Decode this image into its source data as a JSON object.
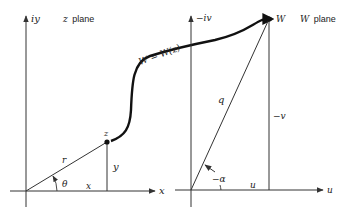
{
  "left_plane": {
    "title_var": "z",
    "title_word": "plane",
    "y_axis_label": "iy",
    "x_axis_label": "x",
    "point_label": "z",
    "radius_label": "r",
    "angle_label": "θ",
    "x_component_label": "x",
    "y_component_label": "y"
  },
  "right_plane": {
    "title_var": "W",
    "title_word": "plane",
    "v_axis_label": "−iv",
    "u_axis_label": "u",
    "point_label": "W",
    "magnitude_label": "q",
    "angle_label": "−α",
    "u_component_label": "u",
    "v_component_label": "−v"
  },
  "mapping": {
    "label": "W = W(z)"
  },
  "colors": {
    "line": "#333333",
    "curve": "#111111",
    "background": "#ffffff"
  }
}
